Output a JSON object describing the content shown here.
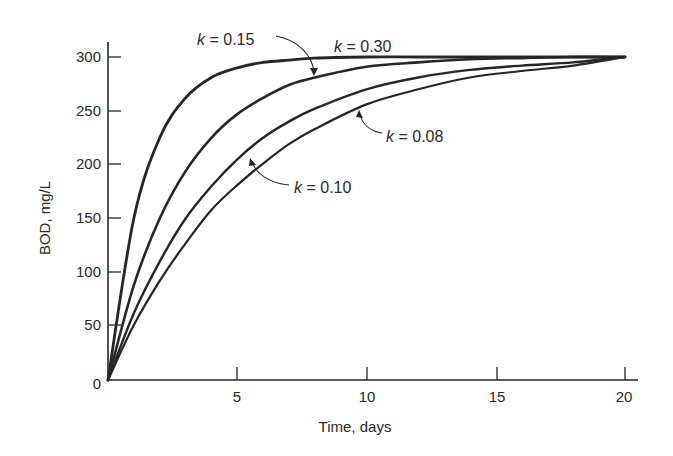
{
  "chart_data": {
    "type": "line",
    "title": "",
    "xlabel": "Time, days",
    "ylabel": "BOD, mg/L",
    "xlim": [
      0,
      20
    ],
    "ylim": [
      0,
      300
    ],
    "x_ticks": [
      5,
      10,
      15,
      20
    ],
    "y_ticks": [
      0,
      50,
      100,
      150,
      200,
      250,
      300
    ],
    "grid": false,
    "legend": "none (curves labeled by inline annotations with arrows)",
    "x": [
      0,
      1,
      2,
      3,
      4,
      5,
      6,
      7,
      8,
      10,
      12,
      14,
      16,
      18,
      20
    ],
    "series": [
      {
        "name": "k = 0.30",
        "values": [
          0,
          150,
          225,
          262,
          281,
          290,
          295,
          297,
          299,
          300,
          300,
          300,
          300,
          300,
          300
        ]
      },
      {
        "name": "k = 0.15",
        "values": [
          0,
          88,
          150,
          194,
          225,
          247,
          262,
          274,
          281,
          291,
          295,
          298,
          299,
          300,
          300
        ]
      },
      {
        "name": "k = 0.10",
        "values": [
          0,
          62,
          110,
          150,
          180,
          205,
          225,
          240,
          252,
          270,
          281,
          288,
          292,
          295,
          300
        ]
      },
      {
        "name": "k = 0.08",
        "values": [
          0,
          51,
          92,
          127,
          158,
          181,
          201,
          219,
          233,
          256,
          270,
          281,
          287,
          292,
          300
        ]
      }
    ],
    "annotations": [
      {
        "text": "k = 0.15",
        "points_to": "second curve from top"
      },
      {
        "text": "k = 0.30",
        "points_to": "top curve"
      },
      {
        "text": "k = 0.08",
        "points_to": "bottom curve"
      },
      {
        "text": "k = 0.10",
        "points_to": "third curve from top"
      }
    ]
  },
  "axes": {
    "xlabel": "Time, days",
    "ylabel": "BOD, mg/L",
    "x_tick_labels": [
      "5",
      "10",
      "15",
      "20"
    ],
    "y_tick_labels": [
      "0",
      "50",
      "100",
      "150",
      "200",
      "250",
      "300"
    ]
  },
  "annotations": {
    "k015": {
      "var": "k",
      "rest": " = 0.15"
    },
    "k030": {
      "var": "k",
      "rest": " = 0.30"
    },
    "k008": {
      "var": "k",
      "rest": " = 0.08"
    },
    "k010": {
      "var": "k",
      "rest": " = 0.10"
    }
  },
  "colors": {
    "line": "#262626",
    "text": "#2a2a2a",
    "background": "#ffffff"
  }
}
